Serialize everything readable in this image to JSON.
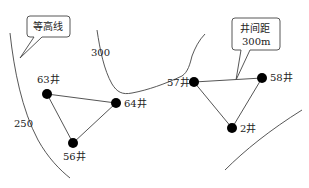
{
  "diagram": {
    "callouts": {
      "contour_legend": {
        "text": "等高线"
      },
      "spacing": {
        "line1": "井间距",
        "line2": "300m"
      }
    },
    "contours": [
      {
        "id": "contour-250",
        "label": "250"
      },
      {
        "id": "contour-300",
        "label": "300"
      },
      {
        "id": "contour-lower-right",
        "label": ""
      }
    ],
    "wells": [
      {
        "id": "well-63",
        "label": "63井"
      },
      {
        "id": "well-64",
        "label": "64井"
      },
      {
        "id": "well-56",
        "label": "56井"
      },
      {
        "id": "well-57",
        "label": "57井"
      },
      {
        "id": "well-58",
        "label": "58井"
      },
      {
        "id": "well-2",
        "label": "2井"
      }
    ],
    "groups": [
      {
        "name": "left-triangle",
        "wells": [
          "63井",
          "64井",
          "56井"
        ]
      },
      {
        "name": "right-triangle",
        "wells": [
          "57井",
          "58井",
          "2井"
        ]
      }
    ],
    "colors": {
      "line": "#444444",
      "well": "#000000",
      "background": "#ffffff"
    }
  }
}
